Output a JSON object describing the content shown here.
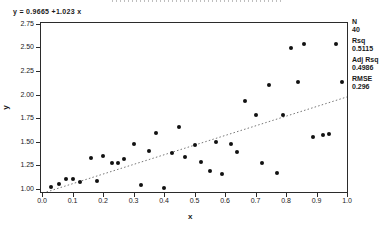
{
  "equation": "y = 0.9665 +1.023 x",
  "legend": {
    "items": [
      {
        "label": "N",
        "value": "40"
      },
      {
        "label": "Rsq",
        "value": "0.5115"
      },
      {
        "label": "Adj Rsq",
        "value": "0.4986"
      },
      {
        "label": "RMSE",
        "value": "0.296"
      }
    ]
  },
  "colors": {
    "dot": "#111111",
    "regression_line": "#666666",
    "frame": "#2b2b2b",
    "background": "#ffffff"
  },
  "chart_data": {
    "type": "scatter",
    "title": "",
    "xlabel": "x",
    "ylabel": "y",
    "xlim": [
      0.0,
      1.0
    ],
    "ylim": [
      1.0,
      2.75
    ],
    "grid": false,
    "legend_position": "right-outside",
    "x_ticks": [
      "0.0",
      "0.1",
      "0.2",
      "0.3",
      "0.4",
      "0.5",
      "0.6",
      "0.7",
      "0.8",
      "0.9",
      "1.0"
    ],
    "y_ticks": [
      "1.00",
      "1.25",
      "1.50",
      "1.75",
      "2.00",
      "2.25",
      "2.50",
      "2.75"
    ],
    "points": [
      [
        0.03,
        1.02
      ],
      [
        0.055,
        1.05
      ],
      [
        0.08,
        1.1
      ],
      [
        0.1,
        1.11
      ],
      [
        0.125,
        1.07
      ],
      [
        0.16,
        1.33
      ],
      [
        0.18,
        1.08
      ],
      [
        0.2,
        1.35
      ],
      [
        0.23,
        1.27
      ],
      [
        0.25,
        1.28
      ],
      [
        0.27,
        1.32
      ],
      [
        0.3,
        1.48
      ],
      [
        0.325,
        1.04
      ],
      [
        0.35,
        1.4
      ],
      [
        0.375,
        1.59
      ],
      [
        0.4,
        1.01
      ],
      [
        0.425,
        1.38
      ],
      [
        0.45,
        1.66
      ],
      [
        0.47,
        1.34
      ],
      [
        0.5,
        1.47
      ],
      [
        0.52,
        1.29
      ],
      [
        0.55,
        1.19
      ],
      [
        0.57,
        1.5
      ],
      [
        0.59,
        1.16
      ],
      [
        0.62,
        1.48
      ],
      [
        0.64,
        1.39
      ],
      [
        0.665,
        1.93
      ],
      [
        0.7,
        1.78
      ],
      [
        0.72,
        1.27
      ],
      [
        0.745,
        2.1
      ],
      [
        0.77,
        1.17
      ],
      [
        0.79,
        1.78
      ],
      [
        0.815,
        2.49
      ],
      [
        0.84,
        2.13
      ],
      [
        0.86,
        2.54
      ],
      [
        0.89,
        1.55
      ],
      [
        0.92,
        1.57
      ],
      [
        0.94,
        1.58
      ],
      [
        0.965,
        2.54
      ],
      [
        0.985,
        2.13
      ]
    ],
    "regression": {
      "intercept": 0.9665,
      "slope": 1.023,
      "line_style": "dotted",
      "equation_text": "y = 0.9665 +1.023 x"
    },
    "stats": {
      "N": 40,
      "Rsq": 0.5115,
      "Adj_Rsq": 0.4986,
      "RMSE": 0.296
    }
  }
}
